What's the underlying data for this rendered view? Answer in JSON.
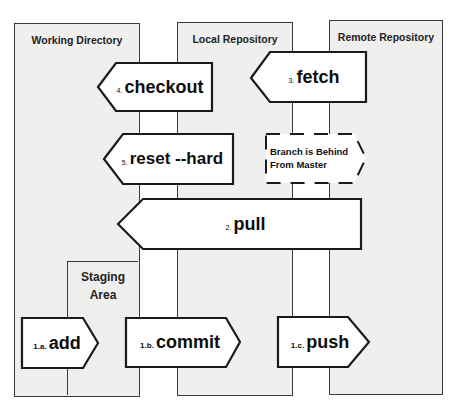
{
  "diagram": {
    "columns": [
      {
        "id": "working-directory",
        "title": "Working Directory"
      },
      {
        "id": "local-repository",
        "title": "Local Repository"
      },
      {
        "id": "remote-repository",
        "title": "Remote Repository"
      }
    ],
    "staging_area": {
      "title_line1": "Staging",
      "title_line2": "Area"
    },
    "commands": [
      {
        "id": "checkout",
        "number": "4.",
        "name": "checkout",
        "direction": "left",
        "from": "Local Repository",
        "to": "Working Directory"
      },
      {
        "id": "fetch",
        "number": "3.",
        "name": "fetch",
        "direction": "left",
        "from": "Remote Repository",
        "to": "Local Repository"
      },
      {
        "id": "reset-hard",
        "number": "5.",
        "name": "reset --hard",
        "direction": "left",
        "from": "Local Repository",
        "to": "Working Directory"
      },
      {
        "id": "pull",
        "number": "2.",
        "name": "pull",
        "direction": "left",
        "from": "Remote Repository",
        "to": "Working Directory"
      },
      {
        "id": "add",
        "number": "1.a.",
        "name": "add",
        "direction": "right",
        "from": "Working Directory",
        "to": "Staging Area"
      },
      {
        "id": "commit",
        "number": "1.b.",
        "name": "commit",
        "direction": "right",
        "from": "Staging Area",
        "to": "Local Repository"
      },
      {
        "id": "push",
        "number": "1.c.",
        "name": "push",
        "direction": "right",
        "from": "Local Repository",
        "to": "Remote Repository"
      }
    ],
    "status_note": {
      "line1": "Branch is Behind",
      "line2": "From Master",
      "style": "dashed"
    }
  },
  "colors": {
    "column_fill": "#efefee",
    "arrow_fill": "#ffffff",
    "stroke": "#1a1a1a",
    "background": "#ffffff"
  }
}
